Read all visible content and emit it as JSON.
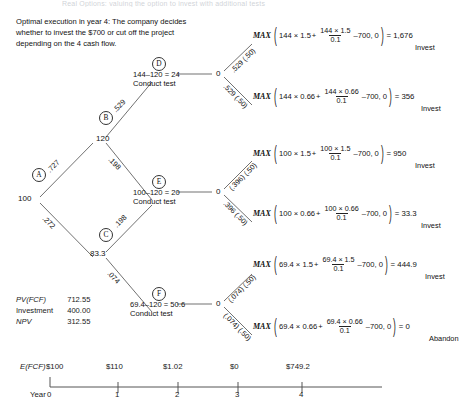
{
  "top_strip_text": "Real Options: valuing the option to invest with additional tests",
  "intro": {
    "text": "Optimal execution in year 4: The company decides whether to invest the $700 or cut off the project depending on the 4 cash flow."
  },
  "tree": {
    "nodes": [
      {
        "id": "A",
        "label": "A",
        "value": "100"
      },
      {
        "id": "B",
        "label": "B",
        "value": "120"
      },
      {
        "id": "C",
        "label": "C",
        "value": "83.3"
      },
      {
        "id": "D",
        "label": "D",
        "calc": "144–120 = 24",
        "action": "Conduct test",
        "terminal": "0"
      },
      {
        "id": "E",
        "label": "E",
        "calc": "100–120 = 20",
        "action": "Conduct test",
        "terminal": "0"
      },
      {
        "id": "F",
        "label": "F",
        "calc": "69.4–120 = 50.6",
        "action": "Conduct test",
        "terminal": "0"
      }
    ],
    "branch_probs": {
      "a_up": ".727",
      "a_down": ".272",
      "b_up": ".529",
      "b_down": ".198",
      "c_up": ".198",
      "c_down": ".074"
    }
  },
  "outcomes": [
    {
      "prob": ".529 (.50)",
      "max_label": "MAX",
      "term1": "144 × 1.5",
      "plus": "+",
      "frac_num": "144 × 1.5",
      "frac_den": "0.1",
      "minus": "–700, 0",
      "equals": "= 1,676",
      "action": "Invest"
    },
    {
      "prob": ".529 (.50)",
      "max_label": "MAX",
      "term1": "144 × 0.66",
      "plus": "+",
      "frac_num": "144 × 0.66",
      "frac_den": "0.1",
      "minus": "–700, 0",
      "equals": "= 356",
      "action": "Invest"
    },
    {
      "prob": "(.396) (.50)",
      "max_label": "MAX",
      "term1": "100 × 1.5",
      "plus": "+",
      "frac_num": "100 × 1.5",
      "frac_den": "0.1",
      "minus": "–700, 0",
      "equals": "= 950",
      "action": "Invest"
    },
    {
      "prob": ".396 (.50)",
      "max_label": "MAX",
      "term1": "100 × 0.66",
      "plus": "+",
      "frac_num": "100 × 0.66",
      "frac_den": "0.1",
      "minus": "–700, 0",
      "equals": "= 33.3",
      "action": "Invest"
    },
    {
      "prob": "(.074) (.50)",
      "max_label": "MAX",
      "term1": "69.4 × 1.5",
      "plus": "+",
      "frac_num": "69.4 × 1.5",
      "frac_den": "0.1",
      "minus": "–700, 0",
      "equals": "= 444.9",
      "action": "Invest"
    },
    {
      "prob": "(.074) (.50)",
      "max_label": "MAX",
      "term1": "69.4 × 0.66",
      "plus": "+",
      "frac_num": "69.4 × 0.66",
      "frac_den": "0.1",
      "minus": "–700, 0",
      "equals": "= 0",
      "action": "Abandon"
    }
  ],
  "summary": {
    "rows": [
      {
        "key": "PV(FCF)",
        "value": "712.55",
        "italic": true
      },
      {
        "key": "Investment",
        "value": "400.00",
        "italic": false
      },
      {
        "key": "NPV",
        "value": "312.55",
        "italic": true
      }
    ]
  },
  "timeline": {
    "row_label": "E(FCF)",
    "year_label": "Year",
    "points": [
      {
        "year": "0",
        "value": "$100"
      },
      {
        "year": "1",
        "value": "$110"
      },
      {
        "year": "2",
        "value": "$1.02"
      },
      {
        "year": "3",
        "value": "$0"
      },
      {
        "year": "4",
        "value": "$749.2"
      }
    ]
  }
}
